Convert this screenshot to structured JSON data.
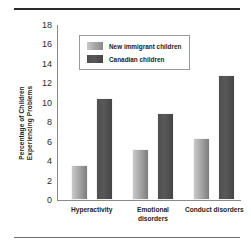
{
  "chart_data": {
    "type": "bar",
    "title": "",
    "xlabel": "",
    "ylabel": "Percentage of Children Experiencing Problems",
    "ylabel_line1": "Percentage of Children",
    "ylabel_line2": "Experiencing Problems",
    "categories": [
      "Hyperactivity",
      "Emotional disorders",
      "Conduct disorders"
    ],
    "category_lines": [
      [
        "Hyperactivity"
      ],
      [
        "Emotional",
        "disorders"
      ],
      [
        "Conduct disorders"
      ]
    ],
    "series": [
      {
        "name": "New immigrant children",
        "color": "#a8a8a8",
        "values": [
          3.6,
          5.2,
          6.4
        ]
      },
      {
        "name": "Canadian children",
        "color": "#4f4f4f",
        "values": [
          10.5,
          8.9,
          12.9
        ]
      }
    ],
    "ylim": [
      0,
      18
    ],
    "ytick_step": 2,
    "yticks": [
      0,
      2,
      4,
      6,
      8,
      10,
      12,
      14,
      16,
      18
    ],
    "ytick_labels": [
      "0",
      "2",
      "4",
      "6",
      "8",
      "10",
      "12",
      "14",
      "16",
      "18"
    ],
    "grid": false,
    "legend_position": "upper-left-inside"
  }
}
